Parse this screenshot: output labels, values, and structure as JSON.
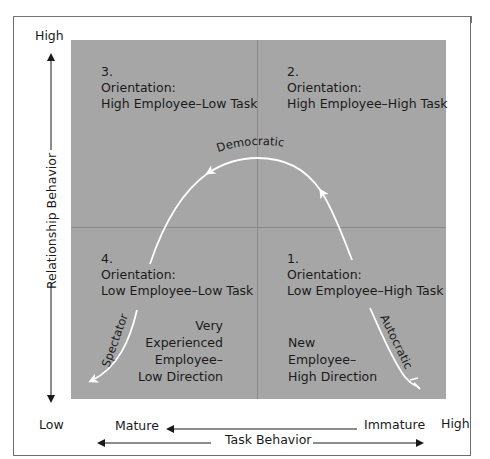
{
  "diagram": {
    "colors": {
      "quadrant_fill": "#a6a6a6",
      "divider": "#8a8a8a",
      "curve": "#ffffff",
      "frame_bar": "#747474",
      "text": "#1a1a1a"
    },
    "y_axis": {
      "label": "Relationship Behavior",
      "high": "High",
      "low": "Low"
    },
    "x_axis": {
      "label": "Task Behavior",
      "high": "High",
      "left_maturity": "Mature",
      "right_maturity": "Immature"
    },
    "quadrants": [
      {
        "number": "3.",
        "title": "Orientation:",
        "subtitle": "High Employee–Low Task",
        "position": "top-left"
      },
      {
        "number": "2.",
        "title": "Orientation:",
        "subtitle": "High Employee–High Task",
        "position": "top-right"
      },
      {
        "number": "4.",
        "title": "Orientation:",
        "subtitle": "Low Employee–Low Task",
        "position": "bottom-left"
      },
      {
        "number": "1.",
        "title": "Orientation:",
        "subtitle": "Low Employee–High Task",
        "position": "bottom-right"
      }
    ],
    "notes": {
      "bottom_left": [
        "Very",
        "Experienced",
        "Employee–",
        "Low Direction"
      ],
      "bottom_right": [
        "New",
        "Employee–",
        "High Direction"
      ]
    },
    "curve_labels": {
      "top": "Democratic",
      "right": "Autocratic",
      "left": "Spectator"
    }
  }
}
